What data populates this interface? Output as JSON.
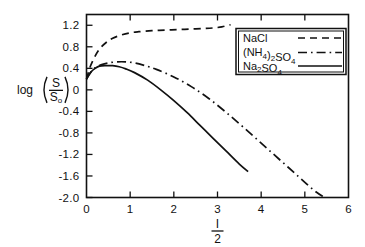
{
  "chart_data": {
    "type": "line",
    "title": "",
    "xlabel": "I/2",
    "xlabel_numerator": "I",
    "xlabel_denominator": "2",
    "ylabel": "log (S/S0)",
    "ylabel_prefix": "log",
    "ylabel_numerator": "S",
    "ylabel_denominator": "S",
    "ylabel_denominator_sub": "o",
    "xlim": [
      0,
      6
    ],
    "ylim": [
      -2.0,
      1.4
    ],
    "xticks": [
      0,
      1,
      2,
      3,
      4,
      5,
      6
    ],
    "xticklabels": [
      "0",
      "1",
      "2",
      "3",
      "4",
      "5",
      "6"
    ],
    "yticks": [
      1.2,
      0.8,
      0.4,
      0,
      -0.4,
      -0.8,
      -1.2,
      -1.6,
      -2.0
    ],
    "yticklabels": [
      "1.2",
      "0.8",
      "0.4",
      "0",
      "-0.4",
      "-0.8",
      "-1.2",
      "-1.6",
      "-2.0"
    ],
    "grid": false,
    "legend_position": "top-right",
    "frame": "box",
    "tick_direction": "in",
    "line_color": "#111111",
    "series": [
      {
        "name": "NaCl",
        "style": "dashed",
        "x": [
          0.0,
          0.08,
          0.18,
          0.3,
          0.45,
          0.6,
          0.8,
          1.0,
          1.2,
          1.5,
          1.8,
          2.1,
          2.4,
          2.7,
          2.9,
          3.1,
          3.2,
          3.3
        ],
        "y": [
          0.2,
          0.42,
          0.6,
          0.76,
          0.88,
          0.96,
          1.02,
          1.06,
          1.08,
          1.1,
          1.11,
          1.12,
          1.13,
          1.14,
          1.15,
          1.17,
          1.19,
          1.21
        ]
      },
      {
        "name": "(NH4)2SO4",
        "style": "dashdot",
        "x": [
          0.0,
          0.1,
          0.2,
          0.35,
          0.5,
          0.7,
          0.9,
          1.1,
          1.3,
          1.6,
          2.0,
          2.4,
          2.8,
          3.2,
          3.6,
          4.0,
          4.4,
          4.8,
          5.2,
          5.45
        ],
        "y": [
          0.2,
          0.33,
          0.41,
          0.47,
          0.5,
          0.52,
          0.52,
          0.5,
          0.46,
          0.38,
          0.24,
          0.06,
          -0.16,
          -0.42,
          -0.7,
          -0.99,
          -1.28,
          -1.57,
          -1.86,
          -2.0
        ]
      },
      {
        "name": "Na2SO4",
        "style": "solid",
        "x": [
          0.0,
          0.1,
          0.2,
          0.3,
          0.45,
          0.6,
          0.75,
          0.9,
          1.1,
          1.4,
          1.7,
          2.0,
          2.3,
          2.6,
          2.9,
          3.2,
          3.5,
          3.7
        ],
        "y": [
          0.2,
          0.33,
          0.4,
          0.44,
          0.45,
          0.45,
          0.43,
          0.39,
          0.32,
          0.18,
          0.0,
          -0.2,
          -0.42,
          -0.66,
          -0.9,
          -1.14,
          -1.38,
          -1.52
        ]
      }
    ],
    "legend": [
      {
        "label": "NaCl",
        "style": "dashed"
      },
      {
        "label": "(NH4)2SO4",
        "style": "dashdot"
      },
      {
        "label": "Na2SO4",
        "style": "solid"
      }
    ]
  }
}
